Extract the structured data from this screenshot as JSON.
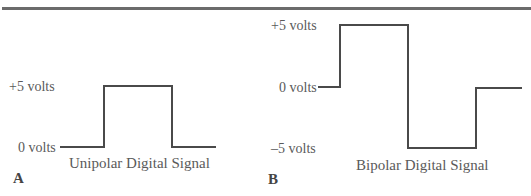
{
  "figure": {
    "panels": [
      {
        "id": "A",
        "panel_label": "A",
        "caption": "Unipolar Digital Signal",
        "levels": [
          "+5 volts",
          "0 volts"
        ],
        "waveform": {
          "levels_volts": [
            0,
            5,
            0
          ]
        }
      },
      {
        "id": "B",
        "panel_label": "B",
        "caption": "Bipolar Digital Signal",
        "levels": [
          "+5 volts",
          "0 volts",
          "–5 volts"
        ],
        "waveform": {
          "levels_volts": [
            0,
            5,
            -5,
            0
          ]
        }
      }
    ],
    "colors": {
      "line": "#4a4a4a",
      "text": "#5a5a5a",
      "rule": "#6b6b6b"
    }
  }
}
